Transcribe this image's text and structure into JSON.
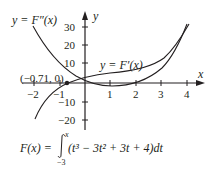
{
  "diagram": {
    "type": "function-graph",
    "axes": {
      "x_label": "x",
      "y_label": "y",
      "x_ticks": [
        "−2",
        "−1",
        "1",
        "2",
        "3",
        "4"
      ],
      "y_ticks": [
        "30",
        "20",
        "10",
        "−10",
        "−20"
      ]
    },
    "curves": [
      {
        "label": "y = F″(x)",
        "description": "second derivative curve, decreasing from top-left, minimum near x=1"
      },
      {
        "label": "y = F′(x)",
        "description": "first derivative curve, increasing, crossing x-axis at (−0.71, 0)"
      }
    ],
    "point": {
      "label": "(−0.71, 0)"
    },
    "formula": {
      "lhs": "F(x) = ",
      "integrand": "(t³ − 3t² + 3t + 4)dt",
      "lower_limit": "−3",
      "upper_limit": "x"
    },
    "colors": {
      "ink": "#231f20",
      "background": "#ffffff"
    }
  }
}
